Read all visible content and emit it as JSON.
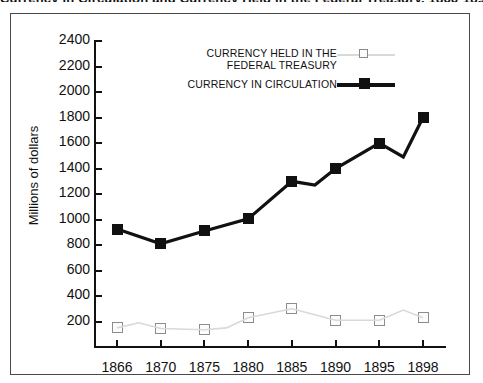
{
  "chart_data": {
    "type": "line",
    "title": "Currency in Circulation and Currency Held in the Federal Treasury, 1866-1898",
    "xlabel": "",
    "ylabel": "Millions of dollars",
    "categories": [
      "1866",
      "1870",
      "1875",
      "1880",
      "1885",
      "1890",
      "1895",
      "1898"
    ],
    "ylim": [
      0,
      2400
    ],
    "yticks": [
      2400,
      2200,
      2000,
      1800,
      1600,
      1400,
      1200,
      1000,
      800,
      600,
      400,
      200
    ],
    "grid": false,
    "legend_position": "top-center",
    "series": [
      {
        "name": "CURRENCY HELD IN THE FEDERAL TREASURY",
        "marker": "open-square",
        "color": "#d9d9d9",
        "marker_edge_color": "#8c8c8c",
        "values": [
          150,
          145,
          135,
          230,
          300,
          210,
          210,
          230
        ]
      },
      {
        "name": "CURRENCY IN CIRCULATION",
        "marker": "filled-square",
        "color": "#111111",
        "marker_edge_color": "#111111",
        "values": [
          925,
          810,
          910,
          1005,
          1300,
          1400,
          1600,
          1800
        ]
      }
    ]
  },
  "legend": {
    "entries": [
      {
        "line1": "CURRENCY HELD IN THE",
        "line2": "FEDERAL TREASURY"
      },
      {
        "line1": "CURRENCY IN CIRCULATION",
        "line2": ""
      }
    ]
  },
  "axis": {
    "y_title": "Millions of dollars",
    "y_labels": [
      "2400",
      "2200",
      "2000",
      "1800",
      "1600",
      "1400",
      "1200",
      "1000",
      "800",
      "600",
      "400",
      "200"
    ],
    "x_labels": [
      "1866",
      "1870",
      "1875",
      "1880",
      "1885",
      "1890",
      "1895",
      "1898"
    ]
  }
}
